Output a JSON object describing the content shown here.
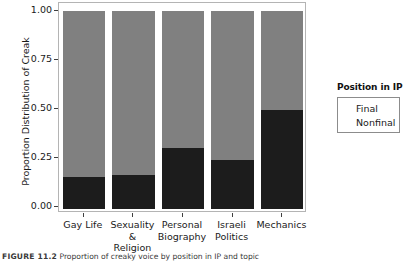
{
  "chart_data": {
    "type": "bar",
    "title": "",
    "subtitle": "",
    "stacked": true,
    "stack_mode": "proportional",
    "orientation": "vertical",
    "xlabel": "",
    "ylabel": "Proportion Distribution of Creak",
    "ylim": [
      0.0,
      1.0
    ],
    "yticks": [
      "0.00",
      "0.25",
      "0.50",
      "0.75",
      "1.00"
    ],
    "ytick_values": [
      0.0,
      0.25,
      0.5,
      0.75,
      1.0
    ],
    "grid": false,
    "legend_position": "right",
    "legend_title": "Position in IP",
    "categories": [
      "Gay Life",
      "Sexuality & Religion",
      "Personal Biography",
      "Israeli Politics",
      "Mechanics"
    ],
    "category_lines": [
      [
        "Gay Life"
      ],
      [
        "Sexuality &",
        "Religion"
      ],
      [
        "Personal",
        "Biography"
      ],
      [
        "Israeli",
        "Politics"
      ],
      [
        "Mechanics"
      ]
    ],
    "series": [
      {
        "name": "Final",
        "color": "#1c1c1c",
        "values": [
          0.16,
          0.17,
          0.31,
          0.25,
          0.5
        ]
      },
      {
        "name": "Nonfinal",
        "color": "#808080",
        "values": [
          0.84,
          0.83,
          0.69,
          0.75,
          0.5
        ]
      }
    ]
  },
  "legend": {
    "title": "Position in IP",
    "entries": [
      {
        "label": "Final",
        "color": "#1c1c1c"
      },
      {
        "label": "Nonfinal",
        "color": "#808080"
      }
    ]
  },
  "axes": {
    "y_title": "Proportion Distribution of Creak",
    "y_ticks": [
      "1.00",
      "0.75",
      "0.50",
      "0.25",
      "0.00"
    ]
  },
  "caption": {
    "number": "FIGURE 11.2",
    "text": "Proportion of creaky voice by position in IP and topic"
  }
}
